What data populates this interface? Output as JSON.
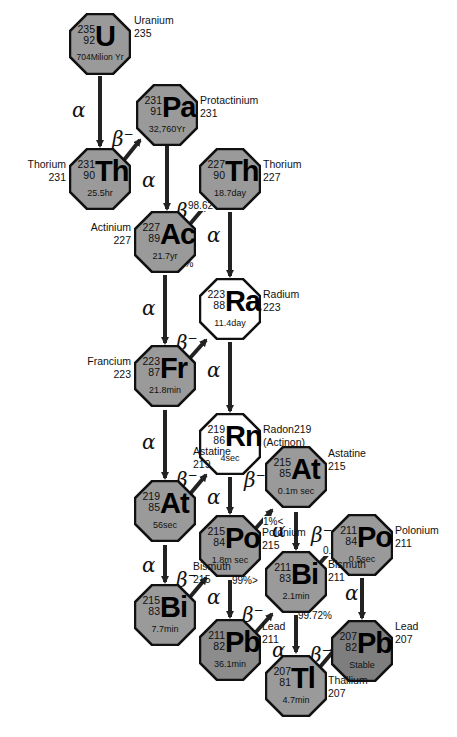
{
  "colors": {
    "gray_fill": "#9a9a9a",
    "dark_fill": "#7e7e7e",
    "white_fill": "#ffffff",
    "outline": "#111111",
    "arrow": "#222222"
  },
  "nuclides": [
    {
      "id": "U235",
      "symbol": "U",
      "mass": "235",
      "z": "92",
      "half_life": "704Milion Yr",
      "name": "Uranium",
      "name_mass": "235",
      "fill": "gray"
    },
    {
      "id": "Pa231",
      "symbol": "Pa",
      "mass": "231",
      "z": "91",
      "half_life": "32,760Yr",
      "name": "Protactinium",
      "name_mass": "231",
      "fill": "gray"
    },
    {
      "id": "Th231",
      "symbol": "Th",
      "mass": "231",
      "z": "90",
      "half_life": "25.5hr",
      "name": "Thorium",
      "name_mass": "231",
      "fill": "gray"
    },
    {
      "id": "Th227",
      "symbol": "Th",
      "mass": "227",
      "z": "90",
      "half_life": "18.7day",
      "name": "Thorium",
      "name_mass": "227",
      "fill": "gray"
    },
    {
      "id": "Ac227",
      "symbol": "Ac",
      "mass": "227",
      "z": "89",
      "half_life": "21.7yr",
      "name": "Actinium",
      "name_mass": "227",
      "fill": "gray"
    },
    {
      "id": "Ra223",
      "symbol": "Ra",
      "mass": "223",
      "z": "88",
      "half_life": "11.4day",
      "name": "Radium",
      "name_mass": "223",
      "fill": "white"
    },
    {
      "id": "Fr223",
      "symbol": "Fr",
      "mass": "223",
      "z": "87",
      "half_life": "21.8min",
      "name": "Francium",
      "name_mass": "223",
      "fill": "gray"
    },
    {
      "id": "Rn219",
      "symbol": "Rn",
      "mass": "219",
      "z": "86",
      "half_life": "4sec",
      "name": "Radon219",
      "name_mass": "(Actinon)",
      "fill": "white"
    },
    {
      "id": "At219",
      "symbol": "At",
      "mass": "219",
      "z": "85",
      "half_life": "56sec",
      "name": "Astatine",
      "name_mass": "219",
      "fill": "gray"
    },
    {
      "id": "At215",
      "symbol": "At",
      "mass": "215",
      "z": "85",
      "half_life": "0.1m sec",
      "name": "Astatine",
      "name_mass": "215",
      "fill": "gray"
    },
    {
      "id": "Po215",
      "symbol": "Po",
      "mass": "215",
      "z": "84",
      "half_life": "1.8m sec",
      "name": "Polonium",
      "name_mass": "215",
      "fill": "gray"
    },
    {
      "id": "Po211",
      "symbol": "Po",
      "mass": "211",
      "z": "84",
      "half_life": "0.5sec",
      "name": "Polonium",
      "name_mass": "211",
      "fill": "gray"
    },
    {
      "id": "Bi215",
      "symbol": "Bi",
      "mass": "215",
      "z": "83",
      "half_life": "7.7min",
      "name": "Bismuth",
      "name_mass": "215",
      "fill": "gray"
    },
    {
      "id": "Bi211",
      "symbol": "Bi",
      "mass": "211",
      "z": "83",
      "half_life": "2.1min",
      "name": "Bismuth",
      "name_mass": "211",
      "fill": "gray"
    },
    {
      "id": "Pb211",
      "symbol": "Pb",
      "mass": "211",
      "z": "82",
      "half_life": "36.1min",
      "name": "Lead",
      "name_mass": "211",
      "fill": "gray"
    },
    {
      "id": "Pb207",
      "symbol": "Pb",
      "mass": "207",
      "z": "82",
      "half_life": "Stable",
      "name": "Lead",
      "name_mass": "207",
      "fill": "dark"
    },
    {
      "id": "Tl207",
      "symbol": "Tl",
      "mass": "207",
      "z": "81",
      "half_life": "4.7min",
      "name": "Thallium",
      "name_mass": "207",
      "fill": "gray"
    }
  ],
  "decays": [
    {
      "from": "U235",
      "to": "Th231",
      "mode": "α"
    },
    {
      "from": "Th231",
      "to": "Pa231",
      "mode": "β−"
    },
    {
      "from": "Pa231",
      "to": "Ac227",
      "mode": "α"
    },
    {
      "from": "Ac227",
      "to": "Th227",
      "mode": "β−",
      "branch": "98.62%"
    },
    {
      "from": "Ac227",
      "to": "Fr223",
      "mode": "α",
      "branch": "1.38%"
    },
    {
      "from": "Th227",
      "to": "Ra223",
      "mode": "α"
    },
    {
      "from": "Fr223",
      "to": "Ra223",
      "mode": "β−"
    },
    {
      "from": "Ra223",
      "to": "Rn219",
      "mode": "α"
    },
    {
      "from": "Fr223",
      "to": "At219",
      "mode": "α"
    },
    {
      "from": "At219",
      "to": "Rn219",
      "mode": "β−"
    },
    {
      "from": "Rn219",
      "to": "Po215",
      "mode": "α"
    },
    {
      "from": "At219",
      "to": "Bi215",
      "mode": "α"
    },
    {
      "from": "Po215",
      "to": "At215",
      "mode": "β−",
      "branch": "1%<"
    },
    {
      "from": "At215",
      "to": "Bi211",
      "mode": "α"
    },
    {
      "from": "Bi215",
      "to": "Po215",
      "mode": "β−"
    },
    {
      "from": "Po215",
      "to": "Pb211",
      "mode": "α",
      "branch": "99%>"
    },
    {
      "from": "Pb211",
      "to": "Bi211",
      "mode": "β−"
    },
    {
      "from": "Bi211",
      "to": "Po211",
      "mode": "β−",
      "branch": "0.28%"
    },
    {
      "from": "Bi211",
      "to": "Tl207",
      "mode": "α",
      "branch": "99.72%"
    },
    {
      "from": "Po211",
      "to": "Pb207",
      "mode": "α"
    },
    {
      "from": "Tl207",
      "to": "Pb207",
      "mode": "β−"
    }
  ],
  "labels": {
    "alpha": "α",
    "beta": "β",
    "beta_sup": "−",
    "pct_98_62": "98.62%",
    "pct_1_38": "1.38%",
    "pct_1_lt": "1%<",
    "pct_99_gt": "99%>",
    "pct_0_28": "0.28%",
    "pct_99_72": "99.72%"
  }
}
